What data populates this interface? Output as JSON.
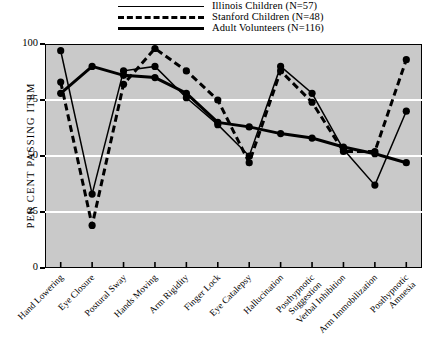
{
  "chart_data": {
    "type": "line",
    "title": "",
    "xlabel": "",
    "ylabel": "PER CENT PASSING ITEM",
    "ylim": [
      0,
      100
    ],
    "yticks": [
      0,
      25,
      50,
      75,
      100
    ],
    "ytick_labels": [
      "0",
      "25",
      "50",
      "75",
      "100"
    ],
    "grid": "horizontal-white-gridlines-at-25-50-75",
    "legend_position": "above-plot",
    "categories": [
      "Hand Lowering",
      "Eye Closure",
      "Postural Sway",
      "Hands Moving",
      "Arm Rigidity",
      "Finger Lock",
      "Eye Catalepsy",
      "Hallucination",
      "Posthypnotic\nSuggestion",
      "Verbal Inhibition",
      "Arm Immobilization",
      "Posthypnotic\nAmnesia"
    ],
    "series": [
      {
        "name": "Illinois Children (N=57)",
        "style": "thin-solid",
        "values": [
          97,
          33,
          88,
          90,
          76,
          64,
          50,
          90,
          78,
          53,
          37,
          70
        ]
      },
      {
        "name": "Stanford Children (N=48)",
        "style": "dashed",
        "values": [
          83,
          19,
          82,
          98,
          88,
          75,
          47,
          88,
          74,
          52,
          52,
          93
        ]
      },
      {
        "name": "Adult Volunteers (N=116)",
        "style": "thick-solid",
        "values": [
          78,
          90,
          86,
          85,
          78,
          65,
          63,
          60,
          58,
          54,
          51,
          47
        ]
      }
    ]
  },
  "legend": {
    "items": [
      {
        "label": "Illinois Children (N=57)",
        "style": "thin-solid"
      },
      {
        "label": "Stanford Children (N=48)",
        "style": "dashed"
      },
      {
        "label": "Adult Volunteers (N=116)",
        "style": "thick-solid"
      }
    ]
  },
  "yaxis": {
    "title": "PER CENT PASSING ITEM"
  }
}
